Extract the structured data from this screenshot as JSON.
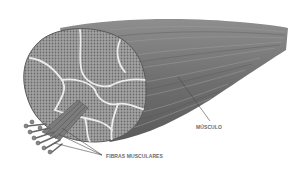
{
  "diagram": {
    "labels": {
      "muscle": "MÚSCULO",
      "fibers": "FIBRAS MUSCULARES"
    },
    "colors": {
      "background": "#ffffff",
      "muscle_body": "#7a7a7a",
      "muscle_dark": "#5e5e5e",
      "fascicle_fill": "#9c9c9c",
      "fascicle_border": "#e8e8e8",
      "fiber_dots": "#6e6e6e",
      "label_text": "#6a6a6a",
      "leader_line": "#4a4a4a"
    }
  }
}
